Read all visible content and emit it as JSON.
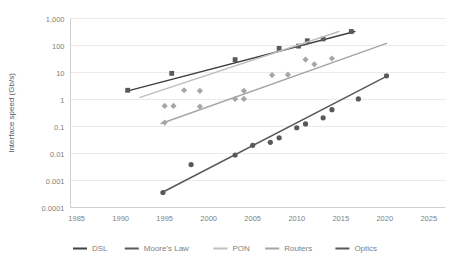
{
  "chart_data": {
    "type": "scatter",
    "title": "",
    "xlabel": "",
    "ylabel": "Interface speed (Gb/s)",
    "xlim": [
      1984.3,
      2026.9
    ],
    "ylim": [
      0.0001,
      1000
    ],
    "yscale": "log",
    "grid": true,
    "legend_position": "bottom",
    "xticks": [
      "1985",
      "1990",
      "1995",
      "2000",
      "2005",
      "2010",
      "2015",
      "2020",
      "2025"
    ],
    "xtick_values": [
      1985,
      1990,
      1995,
      2000,
      2005,
      2010,
      2015,
      2020,
      2025
    ],
    "yticks": [
      "1,000",
      "100",
      "10",
      "1",
      "0.1",
      "0.01",
      "0.001",
      "0.0001"
    ],
    "ytick_values": [
      1000,
      100,
      10,
      1,
      0.1,
      0.01,
      0.001,
      0.0001
    ],
    "series": [
      {
        "name": "DSL",
        "marker": "square",
        "color": "#404040",
        "kind": "trendline",
        "trend": {
          "x0": 1990.6,
          "y0": 2.0,
          "x1": 2016.6,
          "y1": 330.0
        }
      },
      {
        "name": "Moore's Law",
        "marker": "square",
        "color": "#595959",
        "kind": "points",
        "points": [
          {
            "x": 1990.8,
            "y": 2.2
          },
          {
            "x": 1995.8,
            "y": 9.3
          },
          {
            "x": 2003.0,
            "y": 30.0
          },
          {
            "x": 2008.0,
            "y": 78.0
          },
          {
            "x": 2010.2,
            "y": 95.0
          },
          {
            "x": 2011.2,
            "y": 150.0
          },
          {
            "x": 2013.0,
            "y": 175.0
          },
          {
            "x": 2016.2,
            "y": 330.0
          }
        ]
      },
      {
        "name": "PON",
        "marker": "diamond",
        "color": "#bfbfbf",
        "kind": "trendline",
        "trend": {
          "x0": 1992.2,
          "y0": 1.2,
          "x1": 2014.8,
          "y1": 330.0
        }
      },
      {
        "name": "Routers",
        "marker": "diamond",
        "color": "#a6a6a6",
        "kind": "both",
        "trend": {
          "x0": 1994.6,
          "y0": 0.13,
          "x1": 2020.2,
          "y1": 120.0
        },
        "points": [
          {
            "x": 1995.0,
            "y": 0.58
          },
          {
            "x": 1995.0,
            "y": 0.14
          },
          {
            "x": 1996.0,
            "y": 0.58
          },
          {
            "x": 1997.2,
            "y": 2.2
          },
          {
            "x": 1999.0,
            "y": 2.1
          },
          {
            "x": 1999.0,
            "y": 0.55
          },
          {
            "x": 2003.0,
            "y": 1.05
          },
          {
            "x": 2004.0,
            "y": 2.1
          },
          {
            "x": 2004.0,
            "y": 1.05
          },
          {
            "x": 2007.2,
            "y": 8.0
          },
          {
            "x": 2009.0,
            "y": 8.3
          },
          {
            "x": 2011.0,
            "y": 30.0
          },
          {
            "x": 2012.0,
            "y": 20.0
          },
          {
            "x": 2014.0,
            "y": 33.0
          }
        ]
      },
      {
        "name": "Optics",
        "marker": "circle",
        "color": "#595959",
        "kind": "both",
        "trend": {
          "x0": 1994.7,
          "y0": 0.00036,
          "x1": 2020.3,
          "y1": 7.5
        },
        "points": [
          {
            "x": 1994.8,
            "y": 0.00036
          },
          {
            "x": 1998.0,
            "y": 0.0039
          },
          {
            "x": 2005.0,
            "y": 0.02
          },
          {
            "x": 2003.0,
            "y": 0.0088
          },
          {
            "x": 2007.0,
            "y": 0.026
          },
          {
            "x": 2008.0,
            "y": 0.038
          },
          {
            "x": 2010.0,
            "y": 0.09
          },
          {
            "x": 2011.0,
            "y": 0.125
          },
          {
            "x": 2013.0,
            "y": 0.21
          },
          {
            "x": 2014.0,
            "y": 0.42
          },
          {
            "x": 2017.0,
            "y": 1.05
          },
          {
            "x": 2020.2,
            "y": 7.5
          }
        ]
      }
    ]
  },
  "legend": {
    "items": [
      {
        "label": "DSL",
        "color": "#404040"
      },
      {
        "label": "Moore's Law",
        "color": "#595959"
      },
      {
        "label": "PON",
        "color": "#bfbfbf"
      },
      {
        "label": "Routers",
        "color": "#a6a6a6"
      },
      {
        "label": "Optics",
        "color": "#595959"
      }
    ]
  }
}
